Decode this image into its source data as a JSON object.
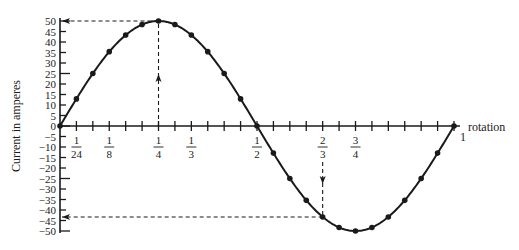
{
  "chart_data": {
    "type": "line",
    "title": "",
    "xlabel": "rotation",
    "ylabel": "Current in amperes",
    "xlim": [
      0,
      1
    ],
    "ylim": [
      -50,
      50
    ],
    "grid": false,
    "legend": null,
    "y_ticks": [
      50,
      45,
      40,
      35,
      30,
      25,
      20,
      15,
      10,
      5,
      0,
      -5,
      -10,
      -15,
      -20,
      -25,
      -30,
      -35,
      -40,
      -45,
      -50
    ],
    "x_tick_step": 0.041667,
    "x_tick_labels": [
      {
        "value": 0.041667,
        "num": "1",
        "den": "24",
        "position": "below"
      },
      {
        "value": 0.125,
        "num": "1",
        "den": "8",
        "position": "below"
      },
      {
        "value": 0.25,
        "num": "1",
        "den": "4",
        "position": "below"
      },
      {
        "value": 0.333333,
        "num": "1",
        "den": "3",
        "position": "below"
      },
      {
        "value": 0.5,
        "num": "1",
        "den": "2",
        "position": "below"
      },
      {
        "value": 0.666667,
        "num": "2",
        "den": "3",
        "position": "below"
      },
      {
        "value": 0.75,
        "num": "3",
        "den": "4",
        "position": "below"
      },
      {
        "value": 1,
        "text": "1",
        "position": "right"
      }
    ],
    "series": [
      {
        "name": "Current",
        "x": [
          0,
          0.041667,
          0.083333,
          0.125,
          0.166667,
          0.208333,
          0.25,
          0.291667,
          0.333333,
          0.375,
          0.416667,
          0.458333,
          0.5,
          0.541667,
          0.583333,
          0.625,
          0.666667,
          0.708333,
          0.75,
          0.791667,
          0.833333,
          0.875,
          0.916667,
          0.958333,
          1
        ],
        "values": [
          0,
          12.9,
          25,
          35.4,
          43.3,
          48.3,
          50,
          48.3,
          43.3,
          35.4,
          25,
          12.9,
          0,
          -12.9,
          -25,
          -35.4,
          -43.3,
          -48.3,
          -50,
          -48.3,
          -43.3,
          -35.4,
          -25,
          -12.9,
          0
        ]
      }
    ],
    "annotations": [
      {
        "type": "dashed-arrow",
        "description": "vertical dashed line from x-axis up to peak at 1/4 rotation, arrow pointing up",
        "x": 0.25,
        "y": 50
      },
      {
        "type": "dashed-arrow",
        "description": "horizontal dashed line from peak to y-axis at 50, arrow pointing left",
        "x": 0.25,
        "y": 50
      },
      {
        "type": "dashed-arrow",
        "description": "vertical dashed line from x-axis down to curve at 2/3 rotation, arrow pointing down",
        "x": 0.666667,
        "y": -43.3
      },
      {
        "type": "dashed-arrow",
        "description": "horizontal dashed line from curve at 2/3 to y-axis at about -43, arrow pointing left",
        "x": 0.666667,
        "y": -43.3
      }
    ]
  },
  "labels": {
    "ylabel": "Current in amperes",
    "rotation": "rotation"
  },
  "colors": {
    "ink": "#1a1a1a",
    "background": "#ffffff"
  }
}
